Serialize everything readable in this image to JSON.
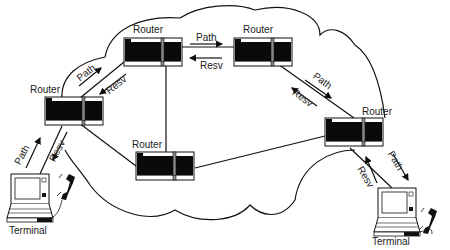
{
  "diagram": {
    "type": "RSVP network diagram",
    "nodes": {
      "router_left": {
        "label": "Router"
      },
      "router_top_l": {
        "label": "Router"
      },
      "router_top_r": {
        "label": "Router"
      },
      "router_bottom": {
        "label": "Router"
      },
      "router_right": {
        "label": "Router"
      },
      "terminal_left": {
        "label": "Terminal"
      },
      "terminal_right": {
        "label": "Terminal"
      }
    },
    "messages": {
      "path": "Path",
      "resv": "Resv"
    },
    "colors": {
      "stroke": "#111111",
      "router_body": "#0a0a0a",
      "background": "#ffffff"
    }
  }
}
